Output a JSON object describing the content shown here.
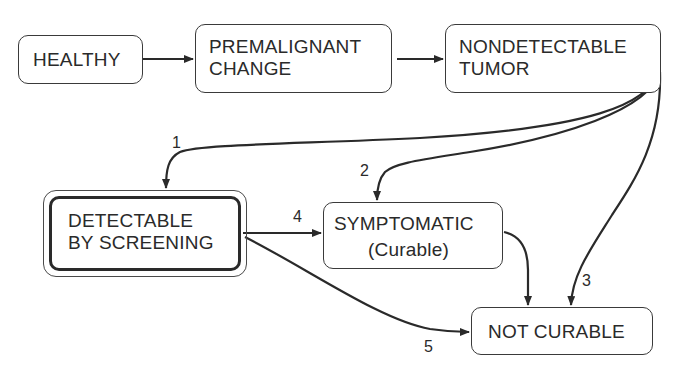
{
  "diagram": {
    "type": "state-transition",
    "nodes": {
      "healthy": {
        "label": "HEALTHY"
      },
      "premalignant": {
        "label": "PREMALIGNANT\nCHANGE"
      },
      "nondetectable": {
        "label": "NONDETECTABLE\nTUMOR"
      },
      "detectable": {
        "label": "DETECTABLE\nBY SCREENING",
        "emphasis": "double-border"
      },
      "symptomatic": {
        "label": "SYMPTOMATIC",
        "sublabel": "(Curable)"
      },
      "not_curable": {
        "label": "NOT CURABLE"
      }
    },
    "edges": [
      {
        "from": "healthy",
        "to": "premalignant",
        "label": ""
      },
      {
        "from": "premalignant",
        "to": "nondetectable",
        "label": ""
      },
      {
        "from": "nondetectable",
        "to": "detectable",
        "label": "1"
      },
      {
        "from": "nondetectable",
        "to": "symptomatic",
        "label": "2"
      },
      {
        "from": "nondetectable",
        "to": "not_curable",
        "label": "3"
      },
      {
        "from": "detectable",
        "to": "symptomatic",
        "label": "4"
      },
      {
        "from": "detectable",
        "to": "not_curable",
        "label": "5"
      },
      {
        "from": "symptomatic",
        "to": "not_curable",
        "label": ""
      }
    ],
    "colors": {
      "stroke": "#2a2a2a",
      "background": "#ffffff"
    }
  }
}
